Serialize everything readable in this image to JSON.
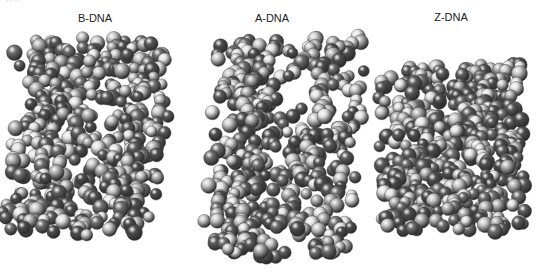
{
  "figure": {
    "panels": [
      {
        "label": "B-DNA",
        "label_x": 95,
        "label_y": 16,
        "box": [
          12,
          40,
          162,
          232
        ],
        "seed": 11
      },
      {
        "label": "A-DNA",
        "label_x": 272,
        "label_y": 16,
        "box": [
          202,
          40,
          345,
          255
        ],
        "seed": 23
      },
      {
        "label": "Z-DNA",
        "label_x": 451,
        "label_y": 15,
        "box": [
          382,
          65,
          522,
          230
        ],
        "seed": 37
      }
    ],
    "atom_colors": [
      "#5a5a5a",
      "#6e6e6e",
      "#c8c8c8",
      "#e2e2e2",
      "#b0b0b0",
      "#4c4c4c"
    ],
    "corner_text": "····"
  }
}
